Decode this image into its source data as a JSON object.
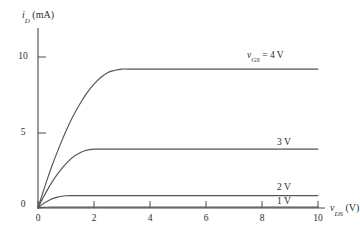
{
  "chart_data": {
    "type": "line",
    "title": "",
    "xlabel": "v_DS (V)",
    "ylabel": "i_D (mA)",
    "xlabel_main": "v",
    "xlabel_sub": "DS",
    "xlabel_unit": "(V)",
    "ylabel_main": "i",
    "ylabel_sub": "D",
    "ylabel_unit": "(mA)",
    "xlim": [
      0,
      10.6
    ],
    "ylim": [
      0,
      11.2
    ],
    "xticks": [
      0,
      2,
      4,
      6,
      8,
      10
    ],
    "xtick_labels": [
      "0",
      "2",
      "4",
      "6",
      "8",
      "10"
    ],
    "yticks": [
      5,
      10
    ],
    "ytick_labels": [
      "5",
      "10"
    ],
    "origin_label": "0",
    "grid": false,
    "legend_position": "inline-right",
    "series": [
      {
        "name": "vGS = 4 V",
        "label": "v_GS = 4 V",
        "label_prefix": "v",
        "label_sub": "GS",
        "label_suffix": "= 4 V",
        "vgs": 4,
        "saturation_current": 9.2,
        "knee_voltage": 3.0,
        "x": [
          0,
          0.15,
          0.3,
          0.5,
          0.75,
          1.0,
          1.25,
          1.5,
          1.75,
          2.0,
          2.25,
          2.5,
          2.7,
          2.85,
          3.0,
          3.2,
          4,
          6,
          8,
          10
        ],
        "y": [
          0,
          0.88,
          1.73,
          2.8,
          4.0,
          5.1,
          6.07,
          6.9,
          7.62,
          8.2,
          8.66,
          8.98,
          9.1,
          9.16,
          9.2,
          9.2,
          9.2,
          9.2,
          9.2,
          9.2
        ]
      },
      {
        "name": "3 V",
        "label": "3 V",
        "vgs": 3,
        "saturation_current": 3.9,
        "knee_voltage": 2.0,
        "x": [
          0,
          0.1,
          0.2,
          0.35,
          0.5,
          0.7,
          0.9,
          1.1,
          1.3,
          1.5,
          1.7,
          1.85,
          2.0,
          2.2,
          3,
          5,
          7,
          10
        ],
        "y": [
          0,
          0.38,
          0.74,
          1.25,
          1.71,
          2.26,
          2.73,
          3.12,
          3.44,
          3.66,
          3.81,
          3.87,
          3.9,
          3.9,
          3.9,
          3.9,
          3.9,
          3.9
        ]
      },
      {
        "name": "2 V",
        "label": "2 V",
        "vgs": 2,
        "saturation_current": 0.82,
        "knee_voltage": 1.0,
        "x": [
          0,
          0.07,
          0.15,
          0.25,
          0.4,
          0.55,
          0.7,
          0.85,
          1.0,
          1.15,
          1.4,
          2,
          4,
          7,
          10
        ],
        "y": [
          0,
          0.11,
          0.23,
          0.36,
          0.52,
          0.64,
          0.72,
          0.78,
          0.81,
          0.82,
          0.82,
          0.82,
          0.82,
          0.82,
          0.82
        ]
      },
      {
        "name": "1 V",
        "label": "1 V",
        "vgs": 1,
        "saturation_current": 0.06,
        "knee_voltage": 0.4,
        "x": [
          0,
          0.1,
          0.2,
          0.3,
          0.45,
          0.7,
          1.5,
          4,
          7,
          10
        ],
        "y": [
          0,
          0.025,
          0.042,
          0.052,
          0.058,
          0.06,
          0.06,
          0.06,
          0.06,
          0.06
        ]
      }
    ],
    "curve_label_positions": [
      {
        "series": "vGS = 4 V",
        "x": 7.4,
        "y": 10.0
      },
      {
        "series": "3 V",
        "x": 8.8,
        "y": 4.75
      },
      {
        "series": "2 V",
        "x": 8.8,
        "y": 1.55
      },
      {
        "series": "1 V",
        "x": 8.8,
        "y": 0.55
      }
    ],
    "colors": {
      "axis": "#4a4a4a",
      "curve": "#555555",
      "text": "#2b2b2b",
      "background": "#ffffff"
    }
  }
}
